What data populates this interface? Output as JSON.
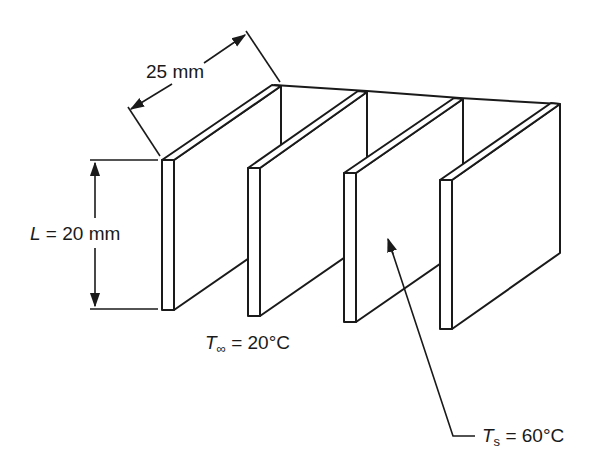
{
  "diagram": {
    "type": "isometric fin array",
    "fin_count": 4,
    "line_color": "#1a1a1a",
    "background": "#ffffff"
  },
  "labels": {
    "fin_length": {
      "text": "25 mm"
    },
    "fin_height": {
      "var": "L",
      "eq": " = 20 mm"
    },
    "ambient_temp": {
      "var": "T",
      "sub": "∞",
      "eq": " = 20°C"
    },
    "surface_temp": {
      "var": "T",
      "sub": "s",
      "eq": " = 60°C"
    }
  }
}
